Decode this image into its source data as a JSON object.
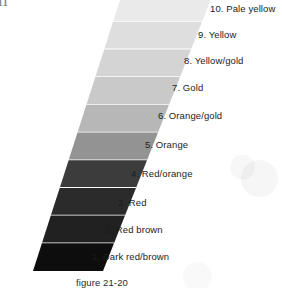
{
  "page": {
    "bleed_text_fragment": "h",
    "caption": "figure 21-20",
    "background_color": "#ffffff"
  },
  "chart_data": {
    "type": "bar",
    "title": "",
    "subtitle": "",
    "xlabel": "",
    "ylabel": "",
    "orientation": "stacked-vertical-gradient-scale",
    "legend_position": "right",
    "grid": false,
    "categories": [
      "1. Dark red/brown",
      "2. Red brown",
      "3. Red",
      "4. Red/orange",
      "5. Orange",
      "6. Orange/gold",
      "7. Gold",
      "8. Yellow/gold",
      "9. Yellow",
      "10. Pale yellow"
    ],
    "values": [
      1,
      2,
      3,
      4,
      5,
      6,
      7,
      8,
      9,
      10
    ],
    "swatch_colors": [
      "#0d0d0d",
      "#212121",
      "#2b2b2b",
      "#3c3c3c",
      "#939393",
      "#b7b7b7",
      "#c9c9c9",
      "#d4d4d4",
      "#dedede",
      "#eaeaea"
    ],
    "ylim": [
      1,
      10
    ]
  },
  "bands": [
    {
      "index": 10,
      "label": "10. Pale yellow",
      "color": "#eaeaea",
      "label_x": 210,
      "label_y": 3
    },
    {
      "index": 9,
      "label": "9. Yellow",
      "color": "#dedede",
      "label_x": 198,
      "label_y": 29
    },
    {
      "index": 8,
      "label": "8. Yellow/gold",
      "color": "#d4d4d4",
      "label_x": 184,
      "label_y": 55
    },
    {
      "index": 7,
      "label": "7. Gold",
      "color": "#c9c9c9",
      "label_x": 172,
      "label_y": 82
    },
    {
      "index": 6,
      "label": "6. Orange/gold",
      "color": "#b7b7b7",
      "label_x": 158,
      "label_y": 110
    },
    {
      "index": 5,
      "label": "5. Orange",
      "color": "#939393",
      "label_x": 145,
      "label_y": 139
    },
    {
      "index": 4,
      "label": "4. Red/orange",
      "color": "#3c3c3c",
      "label_x": 131,
      "label_y": 168
    },
    {
      "index": 3,
      "label": "3. Red",
      "color": "#2b2b2b",
      "label_x": 118,
      "label_y": 197
    },
    {
      "index": 2,
      "label": "2. Red brown",
      "color": "#212121",
      "label_x": 105,
      "label_y": 224
    },
    {
      "index": 1,
      "label": "1. Dark red/brown",
      "color": "#0d0d0d",
      "label_x": 92,
      "label_y": 251
    }
  ],
  "wedge_geometry": {
    "top_left_x": 122,
    "top_right_x": 213,
    "bottom_left_x": 33,
    "bottom_right_x": 103,
    "top_y": -6,
    "bottom_y": 271,
    "separator_color": "#ffffff"
  }
}
